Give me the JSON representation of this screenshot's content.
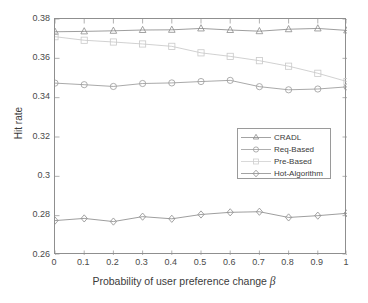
{
  "chart_data": {
    "type": "line",
    "title": "",
    "xlabel": "Probability of user preference change β",
    "ylabel": "Hit rate",
    "x": [
      0,
      0.1,
      0.2,
      0.3,
      0.4,
      0.5,
      0.6,
      0.7,
      0.8,
      0.9,
      1
    ],
    "xlim": [
      0,
      1
    ],
    "ylim": [
      0.26,
      0.38
    ],
    "xticks": [
      "0",
      "0.1",
      "0.2",
      "0.3",
      "0.4",
      "0.5",
      "0.6",
      "0.7",
      "0.8",
      "0.9",
      "1"
    ],
    "yticks": [
      "0.26",
      "0.28",
      "0.3",
      "0.32",
      "0.34",
      "0.36",
      "0.38"
    ],
    "grid": false,
    "legend_position": "center-right",
    "series": [
      {
        "name": "CRADL",
        "marker": "triangle",
        "color": "#8c8c8c",
        "values": [
          0.3735,
          0.3737,
          0.374,
          0.3744,
          0.3745,
          0.3752,
          0.3744,
          0.3738,
          0.3748,
          0.3752,
          0.3742
        ]
      },
      {
        "name": "Req-Based",
        "marker": "circle",
        "color": "#9a9a9a",
        "values": [
          0.3474,
          0.3466,
          0.3457,
          0.3472,
          0.3475,
          0.3482,
          0.3488,
          0.3456,
          0.344,
          0.3444,
          0.3455
        ]
      },
      {
        "name": "Pre-Based",
        "marker": "square",
        "color": "#c9c9c9",
        "values": [
          0.371,
          0.3692,
          0.3683,
          0.3673,
          0.3661,
          0.3628,
          0.361,
          0.3588,
          0.356,
          0.3524,
          0.3482
        ]
      },
      {
        "name": "Hot-Algorithm",
        "marker": "diamond",
        "color": "#8c8c8c",
        "values": [
          0.2775,
          0.2786,
          0.277,
          0.2795,
          0.2784,
          0.2806,
          0.2817,
          0.282,
          0.2791,
          0.28,
          0.2812
        ]
      }
    ]
  },
  "legend": {
    "items": [
      {
        "label": "CRADL"
      },
      {
        "label": "Req-Based"
      },
      {
        "label": "Pre-Based"
      },
      {
        "label": "Hot-Algorithm"
      }
    ]
  },
  "axis": {
    "xlabel_prefix": "Probability of user preference change ",
    "xlabel_symbol": "β",
    "ylabel": "Hit rate"
  }
}
